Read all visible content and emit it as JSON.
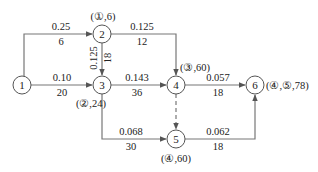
{
  "diagram": {
    "type": "network-flow",
    "nodes": [
      {
        "id": "1",
        "label": "1",
        "annotation": ""
      },
      {
        "id": "2",
        "label": "2",
        "annotation": "(①,6)"
      },
      {
        "id": "3",
        "label": "3",
        "annotation": "(②,24)"
      },
      {
        "id": "4",
        "label": "4",
        "annotation": "(③,60)"
      },
      {
        "id": "5",
        "label": "5",
        "annotation": "(④,60)"
      },
      {
        "id": "6",
        "label": "6",
        "annotation": "(④,⑤,78)"
      }
    ],
    "edges": [
      {
        "from": "1",
        "to": "2",
        "top": "0.25",
        "bottom": "6",
        "style": "solid"
      },
      {
        "from": "1",
        "to": "3",
        "top": "0.10",
        "bottom": "20",
        "style": "solid"
      },
      {
        "from": "2",
        "to": "3",
        "top": "0.125",
        "bottom": "18",
        "style": "solid"
      },
      {
        "from": "2",
        "to": "4",
        "top": "0.125",
        "bottom": "12",
        "style": "solid"
      },
      {
        "from": "3",
        "to": "4",
        "top": "0.143",
        "bottom": "36",
        "style": "solid"
      },
      {
        "from": "3",
        "to": "5",
        "top": "0.068",
        "bottom": "30",
        "style": "solid"
      },
      {
        "from": "4",
        "to": "5",
        "top": "",
        "bottom": "",
        "style": "dashed"
      },
      {
        "from": "4",
        "to": "6",
        "top": "0.057",
        "bottom": "18",
        "style": "solid"
      },
      {
        "from": "5",
        "to": "6",
        "top": "0.062",
        "bottom": "18",
        "style": "solid"
      }
    ]
  }
}
